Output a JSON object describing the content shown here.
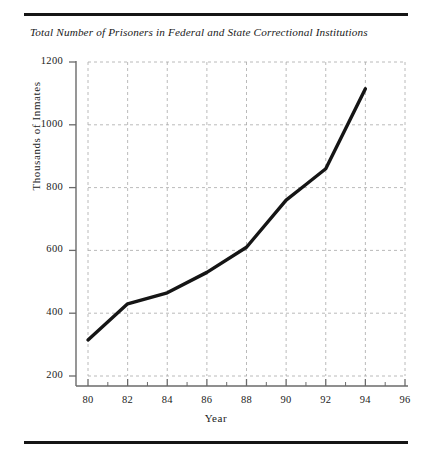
{
  "chart_data": {
    "type": "line",
    "title": "Total Number of Prisoners in Federal and State Correctional Institutions",
    "xlabel": "Year",
    "ylabel": "Thousands of Inmates",
    "xlim": [
      80,
      96
    ],
    "ylim": [
      200,
      1200
    ],
    "grid": true,
    "legend": "none",
    "xticks": [
      "80",
      "82",
      "84",
      "86",
      "88",
      "90",
      "92",
      "94",
      "96"
    ],
    "xtick_values": [
      80,
      82,
      84,
      86,
      88,
      90,
      92,
      94,
      96
    ],
    "xminor_values": [
      81,
      83,
      85,
      87,
      89,
      91,
      93,
      95
    ],
    "yticks": [
      "200",
      "400",
      "600",
      "800",
      "1000",
      "1200"
    ],
    "ytick_values": [
      200,
      400,
      600,
      800,
      1000,
      1200
    ],
    "x": [
      80,
      82,
      84,
      86,
      88,
      90,
      91,
      92,
      94
    ],
    "values": [
      315,
      430,
      465,
      530,
      610,
      760,
      810,
      860,
      1115
    ],
    "series": [
      {
        "name": "Total prisoners",
        "x": [
          80,
          82,
          84,
          86,
          88,
          90,
          91,
          92,
          94
        ],
        "values": [
          315,
          430,
          465,
          530,
          610,
          760,
          810,
          860,
          1115
        ]
      }
    ],
    "line_color": "#151515",
    "grid_color": "#a8a8a8",
    "axis_color": "#6a6a6a"
  },
  "decor": {
    "top_rule": "",
    "bottom_rule": ""
  }
}
